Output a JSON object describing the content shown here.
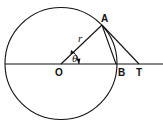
{
  "diagram": {
    "type": "geometry",
    "labels": {
      "O": "O",
      "A": "A",
      "B": "B",
      "T": "T",
      "r": "r",
      "theta": "θ"
    },
    "colors": {
      "stroke": "#111111",
      "background": "#ffffff"
    }
  }
}
